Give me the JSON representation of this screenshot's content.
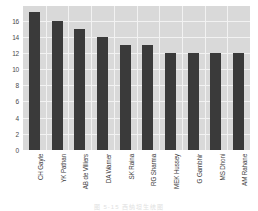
{
  "chart_data": {
    "type": "bar",
    "title": "",
    "xlabel": "",
    "ylabel": "",
    "categories": [
      "CH Gayle",
      "YK Pathan",
      "AB de Villiers",
      "DA Warner",
      "SK Raina",
      "RG Sharma",
      "MEK Hussey",
      "G Gambhir",
      "MS Dhoni",
      "AM Rahane"
    ],
    "values": [
      17,
      16,
      15,
      14,
      13,
      13,
      12,
      12,
      12,
      12
    ],
    "ylim": [
      0,
      17.8
    ],
    "yticks": [
      0,
      2,
      4,
      6,
      8,
      10,
      12,
      14,
      16
    ],
    "ytick_labels": [
      "0",
      "2",
      "4",
      "6",
      "8",
      "10",
      "12",
      "14",
      "16"
    ],
    "grid": true,
    "legend": false,
    "bar_color": "#3a3a3a",
    "plot_background": "#d9d9d9",
    "grid_color": "#f2f2f2",
    "xtick_rotation": 90
  },
  "caption": {
    "text": "图 5-15   西纳坦生统图"
  }
}
